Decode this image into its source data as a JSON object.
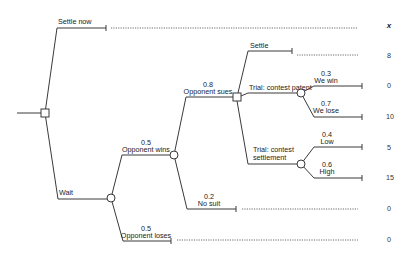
{
  "header": {
    "value_column_label": "x"
  },
  "decision_root": {
    "branches": {
      "settle_now": {
        "label": "Settle now",
        "value": "8"
      },
      "wait": {
        "label": "Wait"
      }
    }
  },
  "wait_chance": {
    "opponent_wins": {
      "prob": "0.5",
      "label": "Opponent wins"
    },
    "opponent_loses": {
      "prob": "0.5",
      "label": "Opponent loses",
      "value": "0"
    }
  },
  "opponent_wins_chance": {
    "opponent_sues": {
      "prob": "0.8",
      "label": "Opponent sues"
    },
    "no_suit": {
      "prob": "0.2",
      "label": "No suit",
      "value": "0"
    }
  },
  "sue_decision": {
    "settle": {
      "label": "Settle",
      "value": "8"
    },
    "trial_patent": {
      "label": "Trial: contest patent"
    },
    "trial_settlement": {
      "label_line1": "Trial: contest",
      "label_line2": "settlement"
    }
  },
  "patent_chance": {
    "we_win": {
      "prob": "0.3",
      "label": "We win",
      "value": "0"
    },
    "we_lose": {
      "prob": "0.7",
      "label": "We lose",
      "value": "10"
    }
  },
  "settlement_chance": {
    "low": {
      "prob": "0.4",
      "label": "Low",
      "value": "5"
    },
    "high": {
      "prob": "0.6",
      "label": "High",
      "value": "15"
    }
  }
}
